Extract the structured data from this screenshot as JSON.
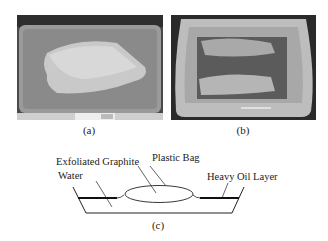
{
  "figure": {
    "panels": [
      {
        "id": "a",
        "label": "(a)",
        "description": "Plastic bag filled with exfoliated graphite placed on tray"
      },
      {
        "id": "b",
        "label": "(b)",
        "description": "Tray with flattened bag after oil sorption"
      },
      {
        "id": "c",
        "label": "(c)",
        "description": "Schematic of bag floating on water with heavy oil layer"
      }
    ],
    "diagram": {
      "labels": {
        "exfoliated_graphite": "Exfoliated Graphite",
        "plastic_bag": "Plastic Bag",
        "water": "Water",
        "heavy_oil_layer": "Heavy Oil Layer"
      }
    },
    "colors": {
      "line": "#222222",
      "oil": "#111111",
      "background": "#ffffff"
    }
  }
}
